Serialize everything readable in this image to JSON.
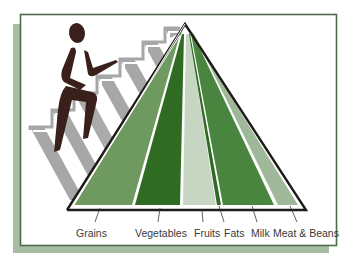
{
  "diagram": {
    "colors": {
      "frame_border": "#4d6b47",
      "frame_shadow": "#a8bca3",
      "pyramid_outline": "#1e1a18",
      "figure": "#3a201a",
      "stairs_shadow": "#a7a7a7",
      "grains": "#6e9a60",
      "vegetables": "#2f6b22",
      "fruits": "#c7d6c3",
      "fats": "#2f6b22",
      "milk": "#4a8540",
      "meat_beans": "#9fb89a",
      "separator": "#f2f7ee"
    },
    "bands": [
      {
        "name": "Grains",
        "label": "Grains"
      },
      {
        "name": "Vegetables",
        "label": "Vegetables"
      },
      {
        "name": "Fruits",
        "label": "Fruits"
      },
      {
        "name": "Fats",
        "label": "Fats"
      },
      {
        "name": "Milk",
        "label": "Milk"
      },
      {
        "name": "Meat & Beans",
        "label": "Meat & Beans"
      }
    ]
  }
}
